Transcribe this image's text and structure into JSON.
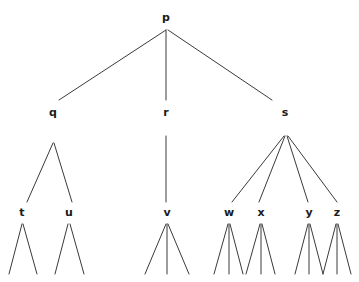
{
  "figure": {
    "type": "tree-diagram",
    "width": 359,
    "height": 282,
    "background_color": "#ffffff",
    "edge_color": "#3a3a3a",
    "label_color": "#1a1a1a",
    "edge_width": 1
  },
  "nodes": [
    {
      "id": "p",
      "label": "p",
      "x": 166,
      "y": 17,
      "level": 0
    },
    {
      "id": "q",
      "label": "q",
      "x": 53,
      "y": 112,
      "level": 1
    },
    {
      "id": "r",
      "label": "r",
      "x": 166,
      "y": 112,
      "level": 1
    },
    {
      "id": "s",
      "label": "s",
      "x": 285,
      "y": 112,
      "level": 1
    },
    {
      "id": "t",
      "label": "t",
      "x": 22,
      "y": 212,
      "level": 2
    },
    {
      "id": "u",
      "label": "u",
      "x": 69,
      "y": 212,
      "level": 2
    },
    {
      "id": "v",
      "label": "v",
      "x": 167,
      "y": 212,
      "level": 2
    },
    {
      "id": "w",
      "label": "w",
      "x": 229,
      "y": 212,
      "level": 2
    },
    {
      "id": "x",
      "label": "x",
      "x": 261,
      "y": 212,
      "level": 2
    },
    {
      "id": "y",
      "label": "y",
      "x": 309,
      "y": 212,
      "level": 2
    },
    {
      "id": "z",
      "label": "z",
      "x": 337,
      "y": 212,
      "level": 2
    }
  ],
  "edges": [
    {
      "from": "p",
      "to": "q",
      "x1": 166,
      "y1": 30,
      "x2": 59,
      "y2": 100
    },
    {
      "from": "p",
      "to": "r",
      "x1": 166,
      "y1": 30,
      "x2": 166,
      "y2": 100
    },
    {
      "from": "p",
      "to": "s",
      "x1": 168,
      "y1": 30,
      "x2": 272,
      "y2": 100
    },
    {
      "from": "q",
      "to": "t",
      "x1": 53,
      "y1": 143,
      "x2": 27,
      "y2": 202
    },
    {
      "from": "q",
      "to": "u",
      "x1": 54,
      "y1": 143,
      "x2": 72,
      "y2": 202
    },
    {
      "from": "r",
      "to": "v",
      "x1": 166,
      "y1": 136,
      "x2": 166,
      "y2": 202
    },
    {
      "from": "s",
      "to": "w",
      "x1": 284,
      "y1": 136,
      "x2": 232,
      "y2": 202
    },
    {
      "from": "s",
      "to": "x",
      "x1": 285,
      "y1": 136,
      "x2": 259,
      "y2": 202
    },
    {
      "from": "s",
      "to": "y",
      "x1": 287,
      "y1": 136,
      "x2": 308,
      "y2": 202
    },
    {
      "from": "s",
      "to": "z",
      "x1": 288,
      "y1": 136,
      "x2": 337,
      "y2": 202
    },
    {
      "from": "t",
      "to": "leaf-t1",
      "x1": 22,
      "y1": 224,
      "x2": 9,
      "y2": 274
    },
    {
      "from": "t",
      "to": "leaf-t2",
      "x1": 23,
      "y1": 224,
      "x2": 37,
      "y2": 274
    },
    {
      "from": "u",
      "to": "leaf-u1",
      "x1": 68,
      "y1": 224,
      "x2": 55,
      "y2": 274
    },
    {
      "from": "u",
      "to": "leaf-u2",
      "x1": 70,
      "y1": 224,
      "x2": 84,
      "y2": 274
    },
    {
      "from": "v",
      "to": "leaf-v1",
      "x1": 166,
      "y1": 224,
      "x2": 145,
      "y2": 274
    },
    {
      "from": "v",
      "to": "leaf-v2",
      "x1": 167,
      "y1": 224,
      "x2": 167,
      "y2": 274
    },
    {
      "from": "v",
      "to": "leaf-v3",
      "x1": 168,
      "y1": 224,
      "x2": 189,
      "y2": 274
    },
    {
      "from": "w",
      "to": "leaf-w1",
      "x1": 228,
      "y1": 224,
      "x2": 214,
      "y2": 274
    },
    {
      "from": "w",
      "to": "leaf-w2",
      "x1": 229,
      "y1": 224,
      "x2": 229,
      "y2": 274
    },
    {
      "from": "w",
      "to": "leaf-w3",
      "x1": 230,
      "y1": 224,
      "x2": 243,
      "y2": 274
    },
    {
      "from": "x",
      "to": "leaf-x1",
      "x1": 260,
      "y1": 224,
      "x2": 246,
      "y2": 274
    },
    {
      "from": "x",
      "to": "leaf-x2",
      "x1": 261,
      "y1": 224,
      "x2": 261,
      "y2": 274
    },
    {
      "from": "x",
      "to": "leaf-x3",
      "x1": 262,
      "y1": 224,
      "x2": 275,
      "y2": 274
    },
    {
      "from": "y",
      "to": "leaf-y1",
      "x1": 308,
      "y1": 224,
      "x2": 295,
      "y2": 274
    },
    {
      "from": "y",
      "to": "leaf-y2",
      "x1": 309,
      "y1": 224,
      "x2": 309,
      "y2": 274
    },
    {
      "from": "y",
      "to": "leaf-y3",
      "x1": 310,
      "y1": 224,
      "x2": 323,
      "y2": 274
    },
    {
      "from": "z",
      "to": "leaf-z1",
      "x1": 336,
      "y1": 224,
      "x2": 323,
      "y2": 274
    },
    {
      "from": "z",
      "to": "leaf-z2",
      "x1": 337,
      "y1": 224,
      "x2": 337,
      "y2": 274
    },
    {
      "from": "z",
      "to": "leaf-z3",
      "x1": 338,
      "y1": 224,
      "x2": 351,
      "y2": 274
    }
  ]
}
